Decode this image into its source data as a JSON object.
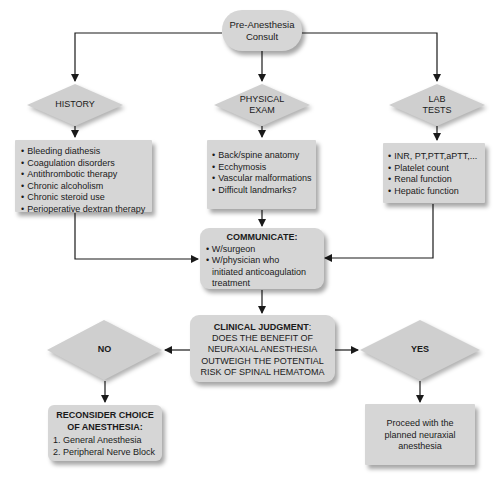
{
  "start": {
    "line1": "Pre-Anesthesia",
    "line2": "Consult"
  },
  "branches": {
    "history": {
      "label": "HISTORY",
      "items": [
        "Bleeding diathesis",
        "Coagulation disorders",
        "Antithrombotic therapy",
        "Chronic alcoholism",
        "Chronic steroid use",
        "Perioperative dextran therapy"
      ]
    },
    "physical_exam": {
      "label_line1": "PHYSICAL",
      "label_line2": "EXAM",
      "items": [
        "Back/spine anatomy",
        "Ecchymosis",
        "Vascular malformations",
        "Difficult  landmarks?"
      ]
    },
    "lab_tests": {
      "label_line1": "LAB",
      "label_line2": "TESTS",
      "items": [
        "INR, PT,PTT,aPTT,...",
        "Platelet count",
        "Renal function",
        "Hepatic function"
      ]
    }
  },
  "communicate": {
    "title": "COMMUNICATE:",
    "items": [
      "W/surgeon",
      "W/physician who",
      "initiated anticoagulation",
      "treatment"
    ]
  },
  "judgment": {
    "title": "CLINICAL JUDGMENT",
    "colon": ":",
    "lines": [
      "DOES THE BENEFIT OF",
      "NEURAXIAL ANESTHESIA",
      "OUTWEIGH THE POTENTIAL",
      "RISK OF SPINAL HEMATOMA"
    ]
  },
  "decision_no": {
    "label": "NO",
    "result_title_line1": "RECONSIDER CHOICE",
    "result_title_line2": "OF ANESTHESIA:",
    "options": [
      "1. General Anesthesia",
      "2. Peripheral Nerve Block"
    ]
  },
  "decision_yes": {
    "label": "YES",
    "result_lines": [
      "Proceed with the",
      "planned neuraxial",
      "anesthesia"
    ]
  },
  "colors": {
    "node_fill": "#d6d6d6",
    "diamond_fill": "#cfcfcf",
    "line": "#1a1a1a"
  }
}
